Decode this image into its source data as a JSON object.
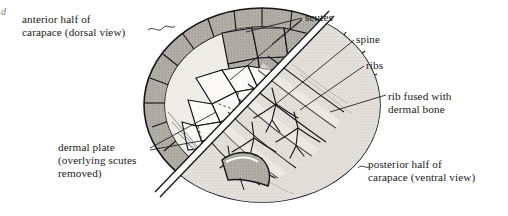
{
  "figure": {
    "mark": "d",
    "background_color": "#ffffff",
    "ink_color": "#1a1a1a",
    "scute_fill": "#a8a49e",
    "plate_fill": "#f2f0ec",
    "rib_fill": "#e6e3de"
  },
  "labels": {
    "anterior": "anterior half of\ncarapace (dorsal view)",
    "dermal_plate": "dermal plate\n(overlying scutes\nremoved)",
    "scutes": "scutes",
    "spine": "spine",
    "ribs": "ribs",
    "rib_fused": "rib fused with\ndermal bone",
    "posterior": "posterior half of\ncarapace (ventral view)"
  }
}
